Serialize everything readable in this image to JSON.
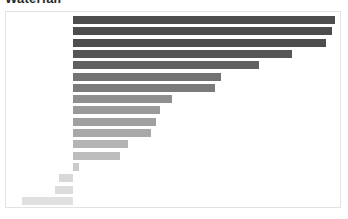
{
  "title": "Waterfall",
  "colors": {
    "background": "#ffffff",
    "frame_border": "#e3e3e3",
    "bar_darkest": "#4a4a4a",
    "bar_lightest": "#e4e4e4"
  },
  "chart_data": {
    "type": "bar",
    "orientation": "horizontal",
    "title": "Waterfall",
    "xlabel": "",
    "ylabel": "",
    "grid": false,
    "legend": false,
    "axis_visible": false,
    "tick_labels_visible": false,
    "baseline": 0,
    "xlim": [
      -12,
      100
    ],
    "categories": [
      "bar-01",
      "bar-02",
      "bar-03",
      "bar-04",
      "bar-05",
      "bar-06",
      "bar-07",
      "bar-08",
      "bar-09",
      "bar-10",
      "bar-11",
      "bar-12",
      "bar-13",
      "bar-14",
      "bar-15",
      "bar-16",
      "bar-17"
    ],
    "values": [
      100,
      98,
      96,
      83,
      71,
      56,
      54,
      38,
      33,
      31,
      30,
      21,
      18,
      2,
      -5,
      -7,
      -19
    ],
    "bar_colors": [
      "#4d4d4d",
      "#4d4d4d",
      "#4d4d4d",
      "#555555",
      "#5f5f5f",
      "#737373",
      "#7b7b7b",
      "#8f8f8f",
      "#9a9a9a",
      "#a0a0a0",
      "#a8a8a8",
      "#b4b4b4",
      "#bdbdbd",
      "#cbcbcb",
      "#d8d8d8",
      "#dcdcdc",
      "#e0e0e0"
    ],
    "bar_pixel_geometry": {
      "zero_x": 67,
      "row_pitch": 11.3,
      "first_row_top": 4,
      "bar_height": 8,
      "right_edges": [
        329,
        326,
        320,
        286,
        253,
        215,
        209,
        166,
        154,
        150,
        145,
        122,
        114,
        73
      ],
      "left_edges_negative": [
        53,
        49,
        16
      ]
    }
  }
}
